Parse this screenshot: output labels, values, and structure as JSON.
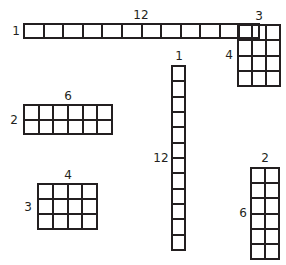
{
  "diagram": {
    "stroke_color": "#231f20",
    "background": "#ffffff",
    "arrays": [
      {
        "id": "12x1",
        "cols": 12,
        "rows": 1,
        "top_label": "12",
        "side_label": "1",
        "x": 23,
        "y": 23,
        "w": 237,
        "h": 16,
        "top_lx": 141,
        "top_ly": 15,
        "side_lx": 16,
        "side_ly": 31
      },
      {
        "id": "3x4",
        "cols": 3,
        "rows": 4,
        "top_label": "3",
        "side_label": "4",
        "x": 237,
        "y": 24,
        "w": 44,
        "h": 63,
        "top_lx": 259,
        "top_ly": 16,
        "side_lx": 229,
        "side_ly": 55
      },
      {
        "id": "6x2",
        "cols": 6,
        "rows": 2,
        "top_label": "6",
        "side_label": "2",
        "x": 23,
        "y": 104,
        "w": 90,
        "h": 31,
        "top_lx": 68,
        "top_ly": 96,
        "side_lx": 14,
        "side_ly": 120
      },
      {
        "id": "4x3",
        "cols": 4,
        "rows": 3,
        "top_label": "4",
        "side_label": "3",
        "x": 37,
        "y": 183,
        "w": 61,
        "h": 47,
        "top_lx": 68,
        "top_ly": 175,
        "side_lx": 28,
        "side_ly": 207
      },
      {
        "id": "1x12",
        "cols": 1,
        "rows": 12,
        "top_label": "1",
        "side_label": "12",
        "x": 171,
        "y": 65,
        "w": 15,
        "h": 186,
        "top_lx": 179,
        "top_ly": 56,
        "side_lx": 161,
        "side_ly": 158
      },
      {
        "id": "2x6",
        "cols": 2,
        "rows": 6,
        "top_label": "2",
        "side_label": "6",
        "x": 250,
        "y": 167,
        "w": 30,
        "h": 93,
        "top_lx": 265,
        "top_ly": 158,
        "side_lx": 243,
        "side_ly": 213
      }
    ]
  }
}
